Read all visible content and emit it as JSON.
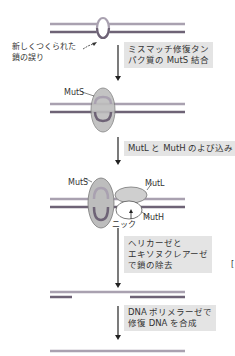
{
  "colors": {
    "strand_light": "#a9a1b0",
    "strand_dark": "#6e6376",
    "muts_fill": "#bdbdbd",
    "mutl_fill": "#cfcfcf",
    "step_box": "#e4e4e4",
    "arrow": "#222222"
  },
  "labels": {
    "mismatch_note_line1": "新しくつくられた",
    "mismatch_note_line2": "鎖の誤り",
    "muts_1": "MutS",
    "muts_2": "MutS",
    "mutl": "MutL",
    "muth": "MutH",
    "nick": "ニック",
    "stray_bracket": "["
  },
  "steps": [
    {
      "line1": "ミスマッチ修復タン",
      "line2": "パク質の MutS 結合"
    },
    {
      "line1": "MutL と MutH のよび込み"
    },
    {
      "line1": "ヘリカーゼと",
      "line2": "エキソヌクレアーゼ",
      "line3": "で鎖の除去"
    },
    {
      "line1": "DNA ポリメラーゼで",
      "line2": "修復 DNA を合成"
    }
  ]
}
